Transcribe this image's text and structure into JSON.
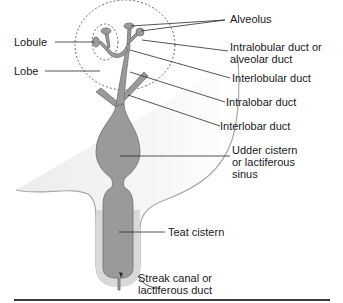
{
  "colors": {
    "duct_fill": "#9a9a9a",
    "duct_stroke": "#6e6e6e",
    "udder_outline": "#9c9c9c",
    "teat_shadow": "#d8d8d8",
    "leader_line": "#2a2a2a",
    "text": "#1a1a1a",
    "rule": "#3a3a3a"
  },
  "labels": {
    "alveolus": "Alveolus",
    "lobule": "Lobule",
    "lobe": "Lobe",
    "intralobular_1": "Intralobular duct or",
    "intralobular_2": "alveolar duct",
    "interlobular": "Interlobular duct",
    "intralobar": "Intralobar duct",
    "interlobar": "Interlobar duct",
    "udder_cistern_1": "Udder cistern",
    "udder_cistern_2": "or lactiferous",
    "udder_cistern_3": "sinus",
    "teat_cistern": "Teat cistern",
    "streak_canal_1": "Streak canal or",
    "streak_canal_2": "lactiferous duct"
  }
}
